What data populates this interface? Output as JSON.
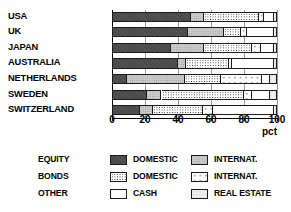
{
  "chart_data": {
    "type": "bar",
    "orientation": "horizontal",
    "stacked": true,
    "title": "",
    "xlabel": "pct",
    "ylabel": "",
    "xlim": [
      0,
      100
    ],
    "xticks": [
      0,
      20,
      40,
      60,
      80,
      100
    ],
    "xtick_labels": [
      "0",
      "20",
      "40",
      "60",
      "80",
      "100"
    ],
    "grid": true,
    "legend_position": "below",
    "categories": [
      "USA",
      "UK",
      "JAPAN",
      "AUSTRALIA",
      "NETHERLANDS",
      "SWEDEN",
      "SWITZERLAND"
    ],
    "series": [
      {
        "name": "EQUITY DOMESTIC",
        "key": "equity-domestic",
        "pattern": "solid-dark-gray",
        "color": "#4a4a4a",
        "values": [
          48,
          46,
          36,
          40,
          9,
          21,
          17
        ]
      },
      {
        "name": "EQUITY INTERNAT.",
        "key": "equity-international",
        "pattern": "solid-light-gray",
        "color": "#c9c9c9",
        "values": [
          8,
          22,
          20,
          5,
          35,
          9,
          8
        ]
      },
      {
        "name": "BONDS DOMESTIC",
        "key": "bonds-domestic",
        "pattern": "dense-dots",
        "color": "#2b2b2b",
        "values": [
          33,
          10,
          29,
          26,
          22,
          50,
          30
        ]
      },
      {
        "name": "BONDS INTERNAT.",
        "key": "bonds-international",
        "pattern": "sparse-dots",
        "color": "#3a3a3a",
        "values": [
          3,
          4,
          5,
          2,
          25,
          5,
          6
        ]
      },
      {
        "name": "CASH",
        "key": "cash",
        "pattern": "white",
        "color": "#ffffff",
        "values": [
          6,
          16,
          8,
          25,
          5,
          11,
          37
        ]
      },
      {
        "name": "REAL ESTATE",
        "key": "real-estate",
        "pattern": "very-light-dots",
        "color": "#f0f0f0",
        "values": [
          2,
          2,
          2,
          2,
          4,
          4,
          2
        ]
      }
    ]
  },
  "axis": {
    "unit_label": "pct"
  },
  "legend": {
    "rows": [
      {
        "group": "EQUITY",
        "left": {
          "label": "DOMESTIC",
          "key": "equity-domestic"
        },
        "right": {
          "label": "INTERNAT.",
          "key": "equity-international"
        }
      },
      {
        "group": "BONDS",
        "left": {
          "label": "DOMESTIC",
          "key": "bonds-domestic"
        },
        "right": {
          "label": "INTERNAT.",
          "key": "bonds-international"
        }
      },
      {
        "group": "OTHER",
        "left": {
          "label": "CASH",
          "key": "cash"
        },
        "right": {
          "label": "REAL ESTATE",
          "key": "real-estate"
        }
      }
    ]
  }
}
